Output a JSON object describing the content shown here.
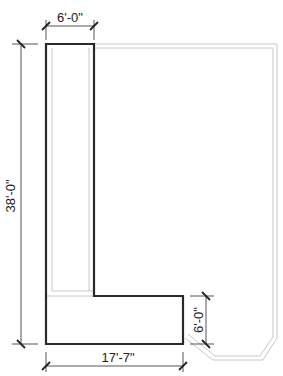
{
  "diagram": {
    "type": "floor-plan",
    "colors": {
      "background": "#ffffff",
      "outline_thick": "#2a2a2a",
      "outline_light": "#c8c8c8",
      "dimension_line": "#555555",
      "text": "#222222"
    },
    "dimensions": {
      "top": "6'-0\"",
      "left": "38'-0\"",
      "bottom": "17'-7\"",
      "right": "6'-0\""
    },
    "shapes": [
      {
        "name": "l-shaped-area",
        "description": "Thick L-shaped outline"
      },
      {
        "name": "room-boundary",
        "description": "Light gray outer room boundary with chamfered bottom-right corner"
      }
    ]
  }
}
